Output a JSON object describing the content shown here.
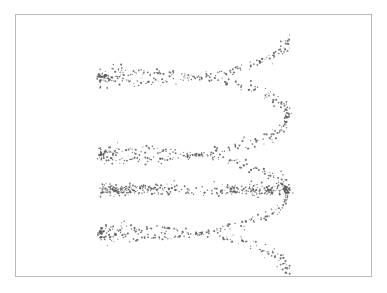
{
  "figure": {
    "background_color": "#ffffff",
    "frame": {
      "border_color": "#b9b9b9",
      "x": 15,
      "y": 14,
      "width": 357,
      "height": 263
    }
  },
  "chart_data": {
    "type": "scatter",
    "title": "",
    "subtitle": "",
    "xlabel": "",
    "ylabel": "",
    "grid": false,
    "legend": null,
    "axes_visible": false,
    "tick_labels_x": [],
    "tick_labels_y": [],
    "xlim": [
      100,
      290
    ],
    "ylim": [
      38,
      272
    ],
    "point_style": {
      "color": "#5a5a5a",
      "size_px": 1.6,
      "marker": "dot",
      "opacity": 0.85
    },
    "n_points": 900,
    "geometry": {
      "center_x": 194,
      "center_y": 155,
      "radius_x": 94,
      "radius_y": 20,
      "turns": 3.0,
      "vertical_span": 234,
      "phase_offset_deg": 0,
      "noise_x": 3.2,
      "noise_y": 2.6
    },
    "coil_bands": [
      {
        "label": "turn-1-top",
        "center_y": 62,
        "y_range": [
          38,
          92
        ]
      },
      {
        "label": "turn-2-middle",
        "center_y": 133,
        "y_range": [
          112,
          165
        ]
      },
      {
        "label": "turn-3-dense-band",
        "center_y": 190,
        "y_range": [
          183,
          199
        ]
      },
      {
        "label": "turn-4-bottom",
        "center_y": 238,
        "y_range": [
          205,
          272
        ]
      }
    ],
    "x_extent": [
      100,
      290
    ],
    "y_extent": [
      38,
      272
    ]
  }
}
